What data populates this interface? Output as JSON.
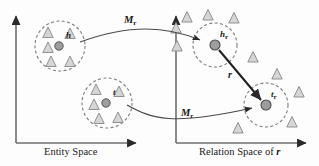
{
  "figure": {
    "type": "diagram",
    "background_color": "#fdfdfd",
    "stroke_color": "#3c3c3c",
    "entity_fill": "#9a9a9a",
    "triangle_fill": "#d4d4d4",
    "triangle_stroke": "#8a8a8a"
  },
  "panels": {
    "left": {
      "axis_label": "Entity Space",
      "origin": {
        "x": 16,
        "y": 143
      },
      "x_axis_end": 140,
      "y_axis_top": 12
    },
    "right": {
      "axis_label_prefix": "Relation Space of ",
      "axis_label_symbol": "r",
      "origin": {
        "x": 176,
        "y": 143
      },
      "x_axis_end": 310,
      "y_axis_top": 12
    }
  },
  "labels": {
    "head_entity": "h",
    "tail_entity": "t",
    "head_projected": "h",
    "head_projected_sub": "r",
    "tail_projected": "t",
    "tail_projected_sub": "r",
    "projection_matrix_top": "M",
    "projection_matrix_top_sub": "r",
    "projection_matrix_bottom": "M",
    "projection_matrix_bottom_sub": "r",
    "relation_vector": "r"
  },
  "clusters": [
    {
      "name": "head-entity-cluster",
      "cx": 60,
      "cy": 46,
      "r": 25,
      "dashed": true,
      "center_dot": {
        "cx": 59,
        "cy": 46,
        "r": 4.2
      },
      "label_pos": {
        "x": 66,
        "y": 38
      },
      "triangles": [
        {
          "cx": 48,
          "cy": 32,
          "size": 11
        },
        {
          "cx": 48,
          "cy": 47,
          "size": 11
        },
        {
          "cx": 51,
          "cy": 62,
          "size": 11
        },
        {
          "cx": 70,
          "cy": 62,
          "size": 11
        },
        {
          "cx": 70,
          "cy": 33,
          "size": 11
        }
      ]
    },
    {
      "name": "tail-entity-cluster",
      "cx": 107,
      "cy": 103,
      "r": 25,
      "dashed": true,
      "center_dot": {
        "cx": 106,
        "cy": 103,
        "r": 4.2
      },
      "label_pos": {
        "x": 113,
        "y": 95
      },
      "triangles": [
        {
          "cx": 96,
          "cy": 89,
          "size": 11
        },
        {
          "cx": 94,
          "cy": 104,
          "size": 11
        },
        {
          "cx": 99,
          "cy": 119,
          "size": 11
        },
        {
          "cx": 118,
          "cy": 118,
          "size": 11
        },
        {
          "cx": 119,
          "cy": 92,
          "size": 11
        }
      ]
    },
    {
      "name": "head-projected-cluster",
      "cx": 215,
      "cy": 45,
      "r": 22,
      "dashed": true,
      "center_dot": {
        "cx": 215,
        "cy": 45,
        "r": 5
      },
      "label_pos": {
        "x": 221,
        "y": 37
      },
      "triangles": []
    },
    {
      "name": "tail-projected-cluster",
      "cx": 266,
      "cy": 105,
      "r": 22,
      "dashed": true,
      "center_dot": {
        "cx": 266,
        "cy": 105,
        "r": 5
      },
      "label_pos": {
        "x": 272,
        "y": 97
      },
      "triangles": []
    }
  ],
  "scattered_triangles": [
    {
      "cx": 187,
      "cy": 17,
      "size": 11
    },
    {
      "cx": 176,
      "cy": 28,
      "size": 11
    },
    {
      "cx": 208,
      "cy": 15,
      "size": 11
    },
    {
      "cx": 234,
      "cy": 18,
      "size": 11
    },
    {
      "cx": 177,
      "cy": 46,
      "size": 11
    },
    {
      "cx": 253,
      "cy": 57,
      "size": 11
    },
    {
      "cx": 277,
      "cy": 74,
      "size": 11
    },
    {
      "cx": 299,
      "cy": 92,
      "size": 11
    },
    {
      "cx": 292,
      "cy": 122,
      "size": 11
    },
    {
      "cx": 238,
      "cy": 128,
      "size": 11
    }
  ],
  "projection_arrows": [
    {
      "name": "head-projection-curve",
      "path": "M 80 42 C 130 24 165 26 199 40",
      "label_pos": {
        "x": 126,
        "y": 22
      }
    },
    {
      "name": "tail-projection-curve",
      "path": "M 127 104 C 155 118 175 124 253 107",
      "label_pos": {
        "x": 180,
        "y": 115
      }
    }
  ],
  "relation_vector_arrow": {
    "name": "relation-vector-r",
    "from": {
      "x": 219,
      "y": 50
    },
    "to": {
      "x": 262,
      "y": 101
    },
    "label_pos": {
      "x": 229,
      "y": 77
    }
  }
}
